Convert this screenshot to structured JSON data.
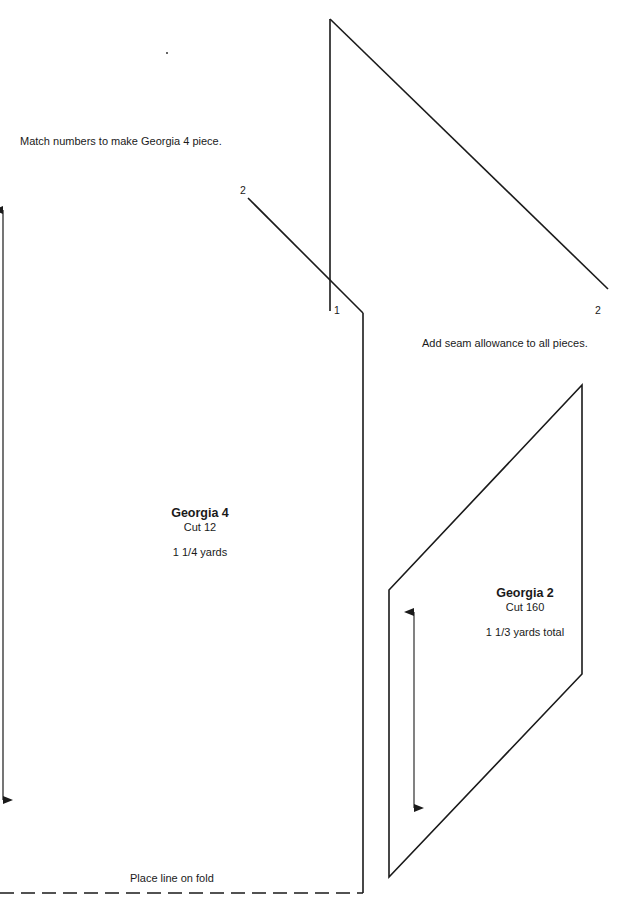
{
  "instructions": {
    "match_numbers": "Match numbers to make Georgia 4 piece.",
    "seam_allowance": "Add seam allowance to all pieces.",
    "fold": "Place line on fold"
  },
  "match_labels": {
    "left_2": "2",
    "triangle_1": "1",
    "triangle_2": "2"
  },
  "pieces": [
    {
      "name": "Georgia 4",
      "cut": "Cut 12",
      "yardage": "1 1/4 yards"
    },
    {
      "name": "Georgia 2",
      "cut": "Cut 160",
      "yardage": "1 1/3 yards total"
    }
  ],
  "colors": {
    "line": "#1a1a1a",
    "background": "#ffffff"
  }
}
